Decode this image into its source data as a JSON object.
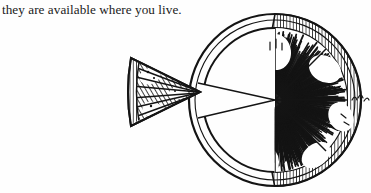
{
  "page": {
    "width": 371,
    "height": 193,
    "background_color": "#fefefe",
    "ink_color": "#141414"
  },
  "text": {
    "body_line": "they are available where you live."
  },
  "illustration": {
    "caption": "",
    "subject": "citrus-fruit-cross-section",
    "style": "pen-and-ink crosshatch engraving",
    "description": "A sliced round citrus fruit seen face-on with one triangular wedge cut out and set to the left of the circle.",
    "parts": [
      {
        "name": "main-slice",
        "label": "citrus slice body",
        "center_x": 275,
        "center_y": 100,
        "radius": 82,
        "segments": 8,
        "notch_start_deg": 168,
        "notch_end_deg": 196
      },
      {
        "name": "detached-wedge",
        "label": "cut wedge",
        "tip_x": 200,
        "tip_y": 92,
        "back_x": 131,
        "back_top_y": 58,
        "back_bottom_y": 122
      }
    ],
    "colors": {
      "ink": "#141414",
      "paper": "#fefefe",
      "pulp_highlight": "#ffffff"
    }
  }
}
